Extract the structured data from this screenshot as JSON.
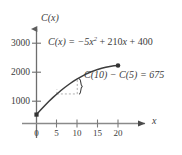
{
  "chart_data": {
    "type": "line",
    "title": "",
    "xlabel": "x",
    "ylabel": "C(x)",
    "equation_text": "C(x) = −5x² + 210x + 400",
    "equation_parts": {
      "lhs": "C(x) = −5",
      "var1": "x",
      "exponent": "2",
      "mid": " + 210",
      "var2": "x",
      "rhs": " + 400"
    },
    "function": "C(x) = -5x^2 + 210x + 400",
    "x": [
      0,
      1,
      2,
      3,
      4,
      5,
      6,
      7,
      8,
      9,
      10,
      11,
      12,
      13,
      14,
      15,
      16,
      17,
      18,
      19,
      20
    ],
    "y": [
      400,
      605,
      800,
      985,
      1160,
      1325,
      1480,
      1625,
      1760,
      1885,
      2000,
      2105,
      2200,
      2285,
      2360,
      2425,
      2480,
      2525,
      2560,
      2585,
      2600
    ],
    "xlim": [
      0,
      22
    ],
    "ylim": [
      0,
      3400
    ],
    "xticks": [
      "0",
      "5",
      "10",
      "15",
      "20"
    ],
    "xtick_values": [
      0,
      5,
      10,
      15,
      20
    ],
    "yticks": [
      "1000",
      "2000",
      "3000"
    ],
    "ytick_values": [
      1000,
      2000,
      3000
    ],
    "grid": false,
    "legend": false,
    "markers": [
      {
        "name": "curve-start-point",
        "x": 0,
        "y": 400,
        "shape": "square"
      },
      {
        "name": "curve-end-point",
        "x": 20,
        "y": 2600,
        "shape": "circle"
      }
    ],
    "annotations": [
      {
        "name": "difference-annotation",
        "text": "C(10) − C(5) = 675",
        "x_from": 5,
        "x_to": 10,
        "y_from": 1325,
        "y_to": 2000,
        "value": 675,
        "style": "dashed-box-with-brace"
      }
    ],
    "colors": {
      "ink": "#3c3c3c",
      "curve": "#3c3c3c",
      "axis": "#6e6e6e",
      "dashed": "#9a9a9a",
      "background": "#ffffff"
    }
  },
  "axes": {
    "y_label": "C(x)",
    "x_label": "x"
  },
  "ticks": {
    "y": [
      "3000",
      "2000",
      "1000"
    ],
    "x": [
      "0",
      "5",
      "10",
      "15",
      "20"
    ]
  },
  "annotation": {
    "text_lhs": "C(10) − C(5) = 675"
  }
}
